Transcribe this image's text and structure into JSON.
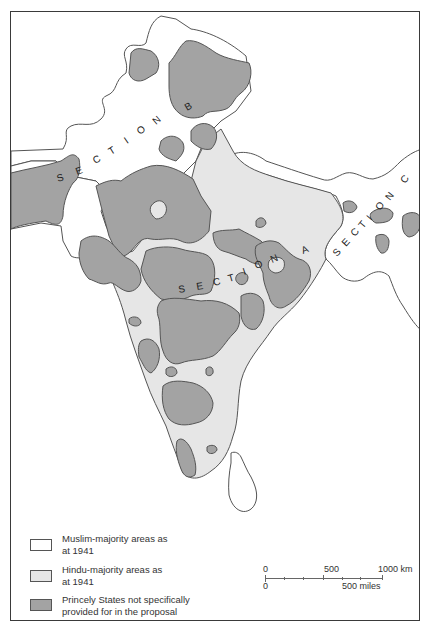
{
  "map": {
    "sections": [
      {
        "label": "S E C T I O N   B",
        "letters": [
          "S",
          "E",
          "C",
          "T",
          "I",
          "O",
          "N",
          "B"
        ]
      },
      {
        "label": "S E C T I O N   A",
        "letters": [
          "S",
          "E",
          "C",
          "T",
          "I",
          "O",
          "N",
          "A"
        ]
      },
      {
        "label": "S E C T I O N   C",
        "letters": [
          "S",
          "E",
          "C",
          "T",
          "I",
          "O",
          "N",
          "C"
        ]
      }
    ],
    "colors": {
      "muslim_majority": "#ffffff",
      "hindu_majority": "#e6e6e6",
      "princely_states": "#a3a3a3",
      "outline": "#555555",
      "frame": "#3a3a3a"
    }
  },
  "legend": {
    "items": [
      {
        "label_line1": "Muslim-majority areas as",
        "label_line2": "at 1941",
        "color": "#ffffff"
      },
      {
        "label_line1": "Hindu-majority areas as",
        "label_line2": "at 1941",
        "color": "#e6e6e6"
      },
      {
        "label_line1": "Princely States not specifically",
        "label_line2": "provided for in the proposal",
        "color": "#a3a3a3"
      }
    ]
  },
  "scale_bar": {
    "km_start": "0",
    "km_mid": "500",
    "km_end": "1000 km",
    "miles_start": "0",
    "miles_end": "500 miles"
  }
}
